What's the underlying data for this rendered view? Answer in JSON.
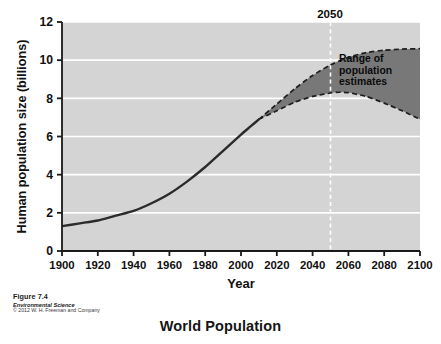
{
  "figure": {
    "caption_figure": "Figure 7.4",
    "caption_source": "Environmental Science",
    "caption_copyright": "© 2012 W. H. Freeman and Company",
    "bottom_title": "World Population"
  },
  "colors": {
    "plot_background": "#d4d4d4",
    "gridline": "#ffffff",
    "axis": "#1a1a1a",
    "history_line": "#2b2b2b",
    "range_fill": "#787878",
    "range_edge": "#1e1e1e",
    "marker_line": "#ffffff",
    "text": "#111111",
    "page_background": "#ffffff"
  },
  "chart_data": {
    "type": "line",
    "title": "World Population",
    "xlabel": "Year",
    "ylabel": "Human population size (billions)",
    "xlim": [
      1900,
      2100
    ],
    "ylim": [
      0,
      12
    ],
    "xticks": [
      1900,
      1920,
      1940,
      1960,
      1980,
      2000,
      2020,
      2040,
      2060,
      2080,
      2100
    ],
    "yticks": [
      0,
      2,
      4,
      6,
      8,
      10,
      12
    ],
    "grid": "horizontal-white-gridlines",
    "legend_position": "inside-upper-right",
    "annotations": [
      {
        "name": "marker-2050",
        "label": "2050",
        "x": 2050,
        "style": "white-dashed-vertical-line"
      },
      {
        "name": "range-legend",
        "label": "Range of population estimates",
        "lines": [
          "Range of",
          "population",
          "estimates"
        ]
      }
    ],
    "series": [
      {
        "name": "Historical population",
        "style": "solid",
        "x": [
          1900,
          1910,
          1920,
          1930,
          1940,
          1950,
          1960,
          1970,
          1980,
          1990,
          2000,
          2005,
          2010
        ],
        "values": [
          1.3,
          1.45,
          1.6,
          1.85,
          2.1,
          2.5,
          3.0,
          3.65,
          4.4,
          5.25,
          6.1,
          6.5,
          6.9
        ]
      },
      {
        "name": "High estimate (upper bound)",
        "style": "dashed",
        "x": [
          2010,
          2020,
          2030,
          2040,
          2050,
          2060,
          2070,
          2080,
          2090,
          2100
        ],
        "values": [
          6.9,
          7.7,
          8.5,
          9.2,
          9.75,
          10.15,
          10.4,
          10.52,
          10.58,
          10.6
        ]
      },
      {
        "name": "Low estimate (lower bound)",
        "style": "dashed",
        "x": [
          2010,
          2020,
          2030,
          2040,
          2050,
          2055,
          2060,
          2070,
          2080,
          2090,
          2100
        ],
        "values": [
          6.9,
          7.35,
          7.8,
          8.1,
          8.28,
          8.32,
          8.3,
          8.1,
          7.75,
          7.35,
          6.9
        ]
      }
    ]
  }
}
